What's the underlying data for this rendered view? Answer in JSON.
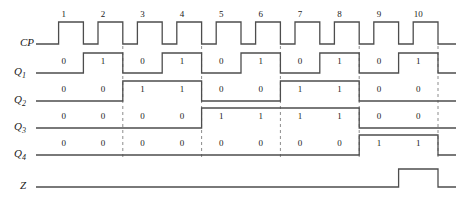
{
  "diagram": {
    "type": "timing-waveform",
    "stroke_color": "#4d4d4d",
    "dash_color": "#8c8c8c",
    "text_color": "#1a1a1a",
    "background": "#ffffff"
  },
  "axis": {
    "clock_numbers": [
      "1",
      "2",
      "3",
      "4",
      "5",
      "6",
      "7",
      "8",
      "9",
      "10"
    ],
    "origin_x": 44,
    "period_px": 39.4,
    "end_x": 438
  },
  "signals": [
    {
      "key": "CP",
      "label": "CP",
      "label_sub": "",
      "row_y": 44,
      "high_px": 22,
      "kind": "clock",
      "show_bits": false,
      "values": [
        1,
        1,
        1,
        1,
        1,
        1,
        1,
        1,
        1,
        1
      ]
    },
    {
      "key": "Q1",
      "label": "Q",
      "label_sub": "1",
      "row_y": 73,
      "high_px": 20,
      "kind": "level",
      "show_bits": true,
      "values": [
        0,
        1,
        0,
        1,
        0,
        1,
        0,
        1,
        0,
        1
      ]
    },
    {
      "key": "Q2",
      "label": "Q",
      "label_sub": "2",
      "row_y": 101,
      "high_px": 20,
      "kind": "level",
      "show_bits": true,
      "values": [
        0,
        0,
        1,
        1,
        0,
        0,
        1,
        1,
        0,
        0
      ]
    },
    {
      "key": "Q3",
      "label": "Q",
      "label_sub": "3",
      "row_y": 128,
      "high_px": 20,
      "kind": "level",
      "show_bits": true,
      "values": [
        0,
        0,
        0,
        0,
        1,
        1,
        1,
        1,
        0,
        0
      ]
    },
    {
      "key": "Q4",
      "label": "Q",
      "label_sub": "4",
      "row_y": 155,
      "high_px": 20,
      "kind": "level",
      "show_bits": true,
      "values": [
        0,
        0,
        0,
        0,
        0,
        0,
        0,
        0,
        1,
        1
      ]
    },
    {
      "key": "Z",
      "label": "Z",
      "label_sub": "",
      "row_y": 187,
      "high_px": 18,
      "kind": "level",
      "show_bits": false,
      "values": [
        0,
        0,
        0,
        0,
        0,
        0,
        0,
        0,
        0,
        1
      ]
    }
  ],
  "gridlines": {
    "slots": [
      2,
      4,
      6,
      8,
      10
    ],
    "top_y": 46,
    "bottom_y": 160
  }
}
